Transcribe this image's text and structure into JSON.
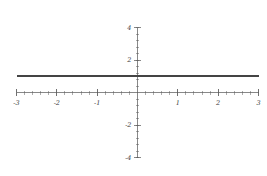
{
  "chart_data": {
    "type": "line",
    "title": "",
    "subtitle": "",
    "xlabel": "",
    "ylabel": "",
    "xlim": [
      -3,
      3
    ],
    "ylim": [
      -4,
      4
    ],
    "grid": false,
    "legend": null,
    "legend_position": "none",
    "x_ticks": [
      -3,
      -2,
      -1,
      1,
      2,
      3
    ],
    "x_tick_labels": [
      "-3",
      "-2",
      "-1",
      "1",
      "2",
      "3"
    ],
    "x_minor_tick_step": 0.2,
    "y_ticks": [
      -4,
      -2,
      2,
      4
    ],
    "y_tick_labels": [
      "-4",
      "-2",
      "2",
      "4"
    ],
    "y_minor_tick_step": 0.4,
    "series": [
      {
        "name": "y = 1",
        "color": "#444444",
        "x": [
          -3,
          -2.5,
          -2,
          -1.5,
          -1,
          -0.5,
          0,
          0.5,
          1,
          1.5,
          2,
          2.5,
          3
        ],
        "values": [
          1,
          1,
          1,
          1,
          1,
          1,
          1,
          1,
          1,
          1,
          1,
          1,
          1
        ]
      }
    ],
    "annotations": [],
    "axis_color": "#555555",
    "background_color": "#ffffff"
  },
  "figure": {
    "width": 267,
    "height": 176
  }
}
